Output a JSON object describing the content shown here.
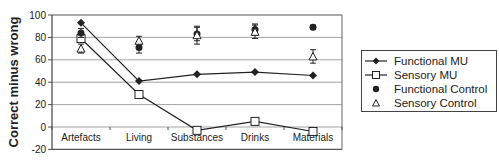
{
  "chart_data": {
    "type": "line",
    "title": "",
    "xlabel": "",
    "ylabel": "Correct minus wrong",
    "ylim": [
      -20,
      100
    ],
    "yticks": [
      100,
      80,
      60,
      40,
      20,
      0,
      -20
    ],
    "grid": true,
    "legend_position": "right",
    "categories": [
      "Artefacts",
      "Living",
      "Substances",
      "Drinks",
      "Materials"
    ],
    "series": [
      {
        "name": "Functional MU",
        "marker": "diamond-filled",
        "line": true,
        "values": [
          93,
          41,
          47,
          49,
          46
        ]
      },
      {
        "name": "Sensory MU",
        "marker": "square-open",
        "line": true,
        "values": [
          79,
          29,
          -3,
          5,
          -4
        ]
      },
      {
        "name": "Functional Control",
        "marker": "circle-filled",
        "line": false,
        "values": [
          84,
          71,
          83,
          87,
          89
        ],
        "error": [
          4,
          5,
          6,
          5,
          2
        ]
      },
      {
        "name": "Sensory Control",
        "marker": "triangle-open",
        "line": false,
        "values": [
          70,
          77,
          82,
          85,
          63
        ],
        "error": [
          4,
          4,
          8,
          6,
          6
        ]
      }
    ]
  },
  "legend": {
    "items": [
      {
        "label": "Functional MU"
      },
      {
        "label": "Sensory MU"
      },
      {
        "label": "Functional Control"
      },
      {
        "label": "Sensory Control"
      }
    ]
  }
}
